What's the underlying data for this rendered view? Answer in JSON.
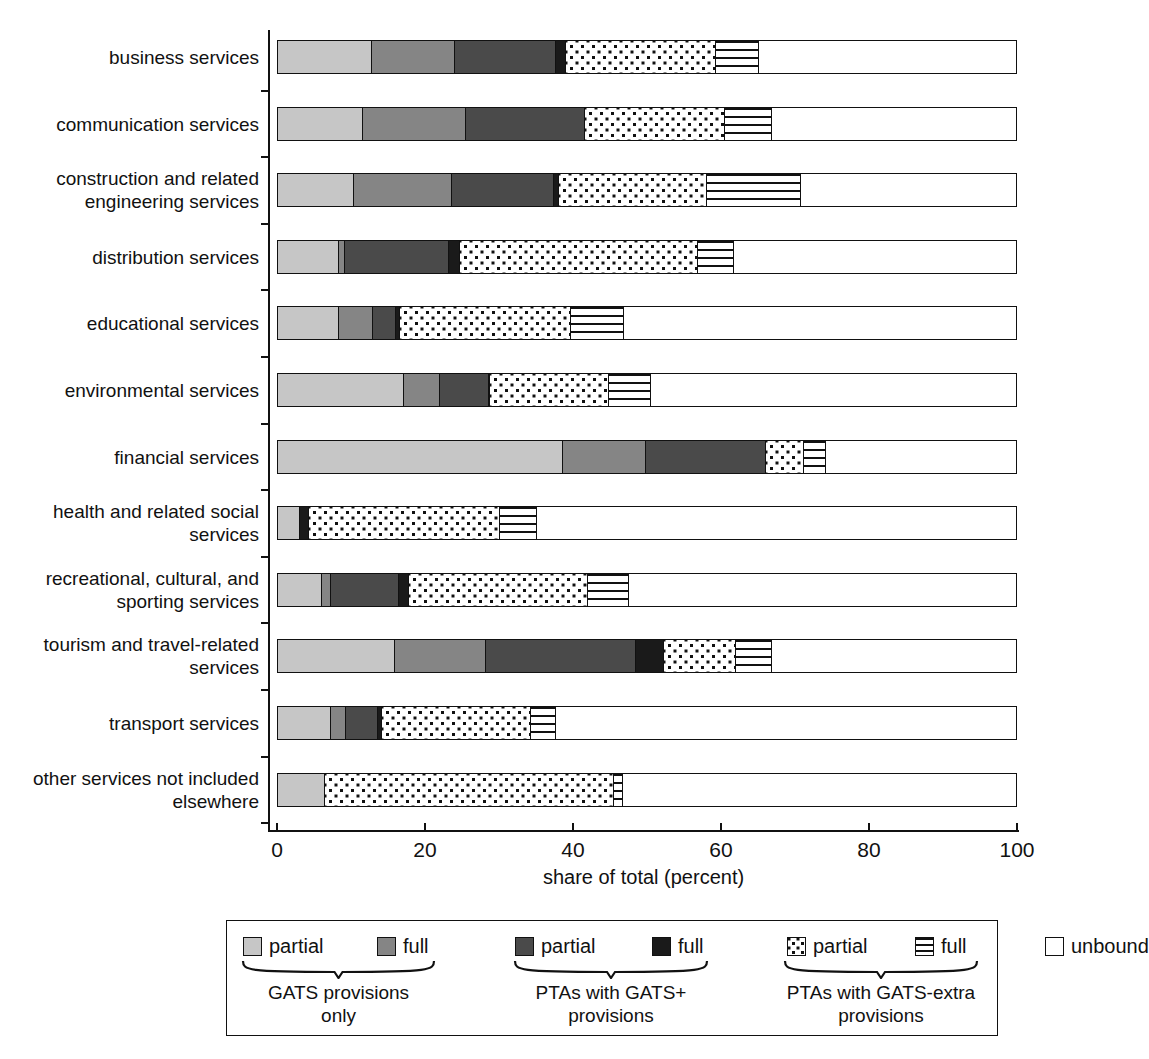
{
  "chart_data": {
    "type": "bar",
    "subtype": "horizontal-stacked",
    "title": "",
    "xlabel": "share of total (percent)",
    "ylabel": "",
    "xlim": [
      0,
      100
    ],
    "xticks": [
      0,
      20,
      40,
      60,
      80,
      100
    ],
    "xticklabels": [
      "0",
      "20",
      "40",
      "60",
      "80",
      "100"
    ],
    "grid": false,
    "legend_position": "bottom",
    "categories": [
      "business services",
      "communication services",
      "construction and related\nengineering services",
      "distribution services",
      "educational services",
      "environmental services",
      "financial services",
      "health and related social\nservices",
      "recreational, cultural, and\nsporting services",
      "tourism and travel-related\nservices",
      "transport services",
      "other services not included\nelsewhere"
    ],
    "series": [
      {
        "name": "GATS provisions only - partial",
        "key": "gats_partial",
        "pattern": "light-grey",
        "color": "#c6c6c6",
        "values": [
          12.6,
          11.4,
          10.1,
          8.1,
          8.1,
          17.0,
          38.5,
          2.8,
          5.8,
          15.7,
          7.0,
          6.2
        ]
      },
      {
        "name": "GATS provisions only - full",
        "key": "gats_full",
        "pattern": "mid-grey",
        "color": "#858585",
        "values": [
          11.2,
          13.9,
          13.3,
          0.8,
          4.6,
          4.8,
          11.2,
          0.0,
          1.2,
          12.4,
          2.1,
          0.0
        ]
      },
      {
        "name": "PTAs with GATS+ provisions - partial",
        "key": "ptaplus_partial",
        "pattern": "dark-grey",
        "color": "#4a4a4a",
        "values": [
          13.8,
          16.1,
          13.8,
          14.2,
          3.2,
          6.6,
          16.3,
          0.0,
          9.2,
          20.3,
          4.3,
          0.0
        ]
      },
      {
        "name": "PTAs with GATS+ provisions - full",
        "key": "ptaplus_full",
        "pattern": "black",
        "color": "#1a1a1a",
        "values": [
          1.3,
          0.0,
          0.8,
          1.4,
          0.5,
          0.2,
          0.0,
          1.3,
          1.4,
          3.8,
          0.5,
          0.0
        ]
      },
      {
        "name": "PTAs with GATS-extra provisions - partial",
        "key": "ptaextra_partial",
        "pattern": "dots",
        "color": "#ffffff",
        "values": [
          20.3,
          19.0,
          20.0,
          32.3,
          23.1,
          16.1,
          5.1,
          25.8,
          24.3,
          9.7,
          20.2,
          39.2
        ]
      },
      {
        "name": "PTAs with GATS-extra provisions - full",
        "key": "ptaextra_full",
        "pattern": "horizontal-stripes",
        "color": "#ffffff",
        "values": [
          5.8,
          6.4,
          12.8,
          4.8,
          7.3,
          5.7,
          3.0,
          5.0,
          5.5,
          4.9,
          3.5,
          1.2
        ]
      },
      {
        "name": "unbound",
        "key": "unbound",
        "pattern": "white",
        "color": "#ffffff",
        "values": [
          35.0,
          33.2,
          29.2,
          38.4,
          53.2,
          49.6,
          25.9,
          65.1,
          52.6,
          33.2,
          62.4,
          53.4
        ]
      }
    ],
    "legend": {
      "entries": [
        {
          "label": "partial",
          "pattern": "light-grey",
          "group": "GATS provisions only"
        },
        {
          "label": "full",
          "pattern": "mid-grey",
          "group": "GATS provisions only"
        },
        {
          "label": "partial",
          "pattern": "dark-grey",
          "group": "PTAs with GATS+ provisions"
        },
        {
          "label": "full",
          "pattern": "black",
          "group": "PTAs with GATS+ provisions"
        },
        {
          "label": "partial",
          "pattern": "dots",
          "group": "PTAs with GATS-extra provisions"
        },
        {
          "label": "full",
          "pattern": "horizontal-stripes",
          "group": "PTAs with GATS-extra provisions"
        },
        {
          "label": "unbound",
          "pattern": "white",
          "group": ""
        }
      ],
      "groups": [
        "GATS provisions\nonly",
        "PTAs with GATS+\nprovisions",
        "PTAs with GATS-extra\nprovisions"
      ]
    }
  },
  "axis": {
    "x_title": "share of total (percent)",
    "ticks": [
      "0",
      "20",
      "40",
      "60",
      "80",
      "100"
    ]
  },
  "rows": [
    {
      "label": "business services"
    },
    {
      "label": "communication services"
    },
    {
      "label": "construction and related\nengineering services"
    },
    {
      "label": "distribution services"
    },
    {
      "label": "educational services"
    },
    {
      "label": "environmental services"
    },
    {
      "label": "financial services"
    },
    {
      "label": "health and related social\nservices"
    },
    {
      "label": "recreational, cultural, and\nsporting services"
    },
    {
      "label": "tourism and travel-related\nservices"
    },
    {
      "label": "transport services"
    },
    {
      "label": "other services not included\nelsewhere"
    }
  ],
  "legend": {
    "items": [
      {
        "label": "partial"
      },
      {
        "label": "full"
      },
      {
        "label": "partial"
      },
      {
        "label": "full"
      },
      {
        "label": "partial"
      },
      {
        "label": "full"
      },
      {
        "label": "unbound"
      }
    ],
    "groups": [
      {
        "label": "GATS provisions\nonly"
      },
      {
        "label": "PTAs with GATS+\nprovisions"
      },
      {
        "label": "PTAs with GATS-extra\nprovisions"
      }
    ]
  }
}
